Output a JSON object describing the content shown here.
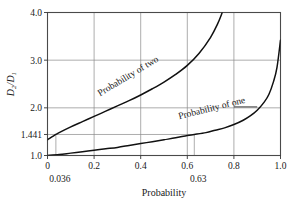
{
  "chart_data": {
    "type": "line",
    "title": "",
    "xlabel": "Probability",
    "ylabel": "D₂/D₁",
    "ylabel_parts": {
      "num": "D",
      "num_sub": "2",
      "den": "D",
      "den_sub": "1"
    },
    "xlim": [
      0,
      1.0
    ],
    "ylim": [
      1.0,
      4.0
    ],
    "grid": true,
    "legend": "inline-curve-labels",
    "xticks": [
      {
        "value": 0,
        "label": "0"
      },
      {
        "value": 0.2,
        "label": "0.2"
      },
      {
        "value": 0.4,
        "label": "0.4"
      },
      {
        "value": 0.6,
        "label": "0.6"
      },
      {
        "value": 0.8,
        "label": "0.8"
      },
      {
        "value": 1.0,
        "label": "1.0"
      }
    ],
    "yticks": [
      {
        "value": 1.0,
        "label": "1.0"
      },
      {
        "value": 1.441,
        "label": "1.441"
      },
      {
        "value": 2.0,
        "label": "2.0"
      },
      {
        "value": 3.0,
        "label": "3.0"
      },
      {
        "value": 4.0,
        "label": "4.0"
      }
    ],
    "annotations": [
      {
        "name": "x-marker-lower",
        "label": "0.036",
        "x": 0.036,
        "y": 1.441
      },
      {
        "name": "x-marker-upper",
        "label": "0.63",
        "x": 0.63,
        "y": 1.441
      }
    ],
    "series": [
      {
        "name": "Probability of two",
        "label": "Probability of two",
        "color": "#111111",
        "x": [
          0.0,
          0.036,
          0.05,
          0.1,
          0.15,
          0.2,
          0.25,
          0.3,
          0.35,
          0.4,
          0.45,
          0.5,
          0.55,
          0.6,
          0.65,
          0.7,
          0.73,
          0.75
        ],
        "y": [
          1.33,
          1.441,
          1.48,
          1.6,
          1.71,
          1.82,
          1.93,
          2.04,
          2.15,
          2.27,
          2.4,
          2.54,
          2.7,
          2.89,
          3.14,
          3.48,
          3.76,
          4.0
        ]
      },
      {
        "name": "Probability of one",
        "label": "Probability of one",
        "color": "#111111",
        "x": [
          0.0,
          0.05,
          0.1,
          0.15,
          0.2,
          0.25,
          0.3,
          0.35,
          0.4,
          0.45,
          0.5,
          0.55,
          0.6,
          0.63,
          0.68,
          0.72,
          0.76,
          0.8,
          0.84,
          0.87,
          0.9,
          0.93,
          0.95,
          0.97,
          0.985,
          1.0
        ],
        "y": [
          1.0,
          1.02,
          1.05,
          1.08,
          1.11,
          1.14,
          1.17,
          1.21,
          1.25,
          1.29,
          1.33,
          1.37,
          1.42,
          1.441,
          1.48,
          1.53,
          1.58,
          1.65,
          1.74,
          1.83,
          1.95,
          2.12,
          2.28,
          2.55,
          2.85,
          3.42
        ]
      }
    ]
  }
}
